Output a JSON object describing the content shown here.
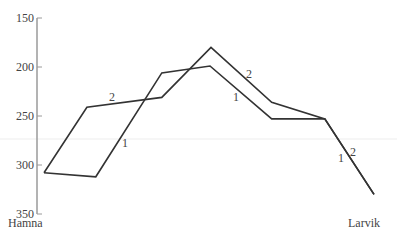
{
  "chart_data": {
    "type": "line",
    "title": "",
    "xlabel": "",
    "ylabel": "",
    "y_axis_inverted": true,
    "ylim": [
      150,
      350
    ],
    "yticks": [
      150,
      200,
      250,
      300,
      350
    ],
    "x_labels": {
      "start": "Hamna",
      "end": "Larvik"
    },
    "grid": false,
    "series": [
      {
        "name": "1",
        "x": [
          0,
          0.157,
          0.357,
          0.503,
          0.69,
          0.851,
          1.0
        ],
        "values": [
          308,
          312,
          206,
          199,
          253,
          253,
          330
        ],
        "label_positions": [
          [
            125,
            143
          ],
          [
            236,
            97
          ],
          [
            341,
            158
          ]
        ]
      },
      {
        "name": "2",
        "x": [
          0,
          0.13,
          0.357,
          0.506,
          0.69,
          0.851,
          1.0
        ],
        "values": [
          308,
          241,
          231,
          180,
          236,
          253,
          330
        ],
        "label_positions": [
          [
            112,
            97
          ],
          [
            249,
            74
          ],
          [
            353,
            152
          ]
        ]
      }
    ],
    "legend": "none"
  },
  "colors": {
    "axis": "#9a9a9a",
    "line": "#333333",
    "text": "#444444",
    "faint_band": "#f2f2f2"
  }
}
